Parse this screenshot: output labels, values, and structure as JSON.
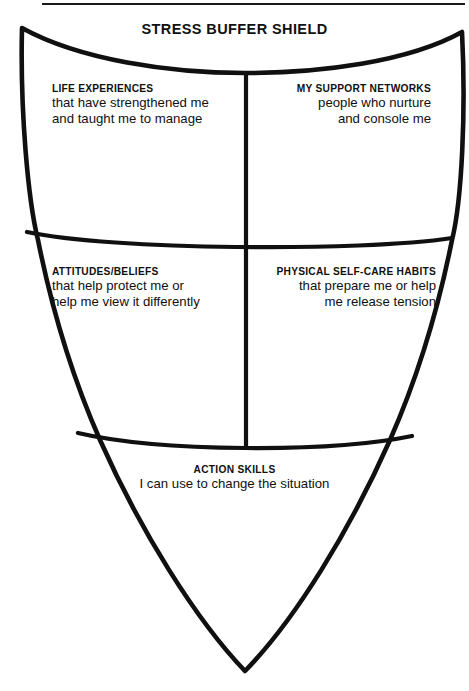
{
  "worksheet": {
    "title": "STRESS BUFFER SHIELD",
    "width": 469,
    "height": 691,
    "ink_color": "#101010",
    "background_color": "#ffffff"
  },
  "sections": {
    "life_experiences": {
      "heading": "LIFE EXPERIENCES",
      "line1": "that have strengthened me",
      "line2": "and taught me to manage"
    },
    "support_networks": {
      "heading": "MY SUPPORT NETWORKS",
      "line1": "people who nurture",
      "line2": "and console me"
    },
    "attitudes_beliefs": {
      "heading": "ATTITUDES/BELIEFS",
      "line1": "that help protect me or",
      "line2": "help me view it differently"
    },
    "self_care_habits": {
      "heading": "PHYSICAL SELF-CARE HABITS",
      "line1": "that prepare me or help",
      "line2": "me release tension"
    },
    "action_skills": {
      "heading": "ACTION SKILLS",
      "line1": "I can use to change the situation"
    }
  }
}
